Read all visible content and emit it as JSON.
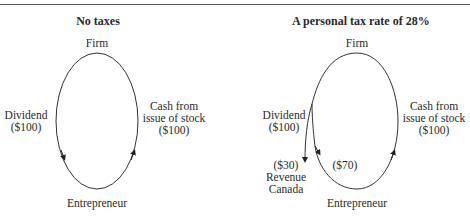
{
  "panels": [
    {
      "title": "No taxes",
      "top_node": "Firm",
      "bottom_node": "Entrepreneur",
      "left_flow": {
        "label": "Dividend",
        "amount": "($100)"
      },
      "right_flow": {
        "label_line1": "Cash from",
        "label_line2": "issue of stock",
        "amount": "($100)"
      }
    },
    {
      "title": "A personal tax rate of 28%",
      "top_node": "Firm",
      "bottom_node": "Entrepreneur",
      "left_flow": {
        "label": "Dividend",
        "amount": "($100)"
      },
      "tax_branch": {
        "amount": "($30)",
        "recipient_line1": "Revenue",
        "recipient_line2": "Canada"
      },
      "net_flow": {
        "amount": "($70)"
      },
      "right_flow": {
        "label_line1": "Cash from",
        "label_line2": "issue of stock",
        "amount": "($100)"
      }
    }
  ]
}
